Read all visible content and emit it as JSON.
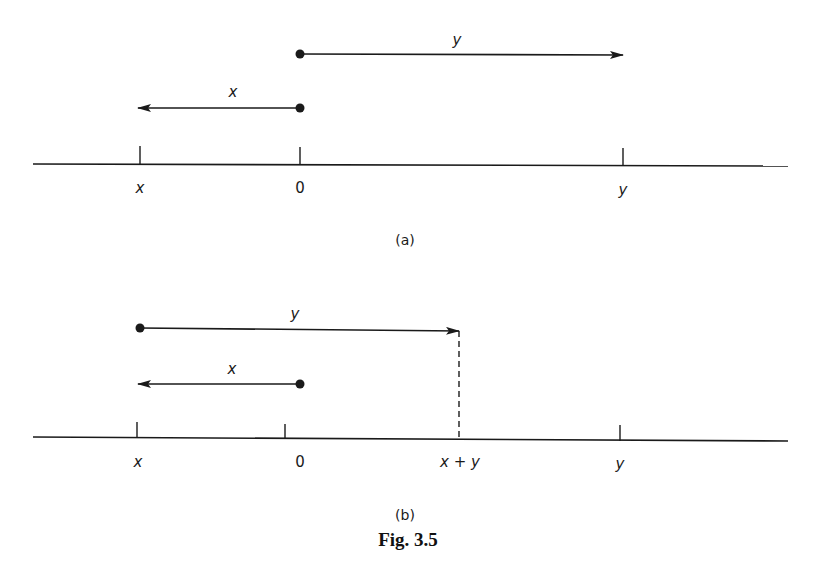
{
  "figure": {
    "caption": "Fig. 3.5",
    "panels": [
      {
        "id": "a",
        "sublabel": "(a)",
        "vectors": [
          {
            "name": "y",
            "label": "y",
            "from": "0",
            "to": "y",
            "direction": "right"
          },
          {
            "name": "x",
            "label": "x",
            "from": "0",
            "to": "x",
            "direction": "left"
          }
        ],
        "ticks": [
          {
            "label": "x"
          },
          {
            "label": "0"
          },
          {
            "label": "y"
          }
        ]
      },
      {
        "id": "b",
        "sublabel": "(b)",
        "vectors": [
          {
            "name": "y",
            "label": "y",
            "from": "x",
            "to": "x + y",
            "direction": "right"
          },
          {
            "name": "x",
            "label": "x",
            "from": "0",
            "to": "x",
            "direction": "left"
          }
        ],
        "ticks": [
          {
            "label": "x"
          },
          {
            "label": "0"
          },
          {
            "label": "x + y"
          },
          {
            "label": "y"
          }
        ]
      }
    ]
  },
  "colors": {
    "ink": "#1a1a1a",
    "background": "#ffffff"
  }
}
